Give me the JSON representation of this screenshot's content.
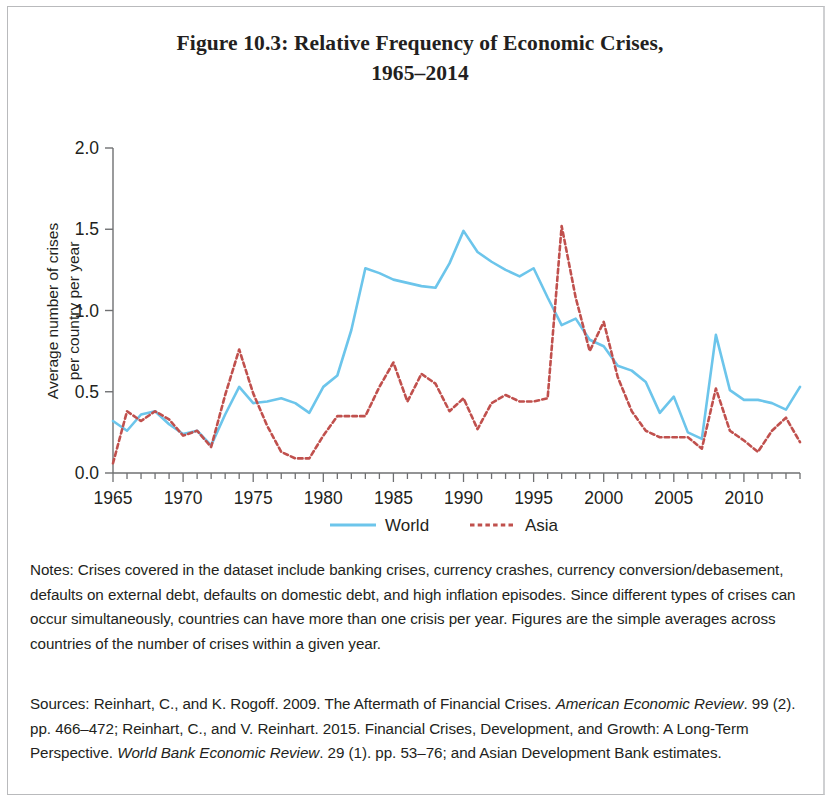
{
  "figure": {
    "title_line1": "Figure 10.3: Relative Frequency of Economic Crises,",
    "title_line2": "1965–2014"
  },
  "axes": {
    "y_axis_label_line1": "Average number of crises",
    "y_axis_label_line2": "per country per year",
    "y_ticks": [
      "0.0",
      "0.5",
      "1.0",
      "1.5",
      "2.0"
    ],
    "x_ticks": [
      "1965",
      "1970",
      "1975",
      "1980",
      "1985",
      "1990",
      "1995",
      "2000",
      "2005",
      "2010"
    ]
  },
  "legend": {
    "items": [
      {
        "label": "World",
        "color": "#6CC5EB",
        "style": "solid"
      },
      {
        "label": "Asia",
        "color": "#C0504D",
        "style": "dotted"
      }
    ]
  },
  "notes": {
    "text": "Notes: Crises covered in the dataset include banking crises, currency crashes, currency conversion/debasement, defaults on external debt, defaults on domestic debt, and high inflation episodes. Since different types of crises can occur simultaneously, countries can have more than one crisis per year. Figures are the simple averages across countries of the number of crises within a given year."
  },
  "sources": {
    "part1": "Sources: Reinhart, C., and K. Rogoff. 2009. The Aftermath of Financial Crises. ",
    "italic1": "American Economic Review",
    "part2": ". 99 (2). pp. 466–472; Reinhart, C., and V. Reinhart. 2015. Financial Crises, Development, and Growth: A Long-Term Perspective. ",
    "italic2": "World Bank Economic Review",
    "part3": ". 29 (1). pp. 53–76; and Asian Development Bank estimates."
  },
  "chart_data": {
    "type": "line",
    "title": "Figure 10.3: Relative Frequency of Economic Crises, 1965–2014",
    "xlabel": "",
    "ylabel": "Average number of crises per country per year",
    "xlim": [
      1965,
      2014
    ],
    "ylim": [
      0.0,
      2.0
    ],
    "yticks": [
      0.0,
      0.5,
      1.0,
      1.5,
      2.0
    ],
    "xticks": [
      1965,
      1970,
      1975,
      1980,
      1985,
      1990,
      1995,
      2000,
      2005,
      2010
    ],
    "grid": false,
    "legend_position": "bottom",
    "x": [
      1965,
      1966,
      1967,
      1968,
      1969,
      1970,
      1971,
      1972,
      1973,
      1974,
      1975,
      1976,
      1977,
      1978,
      1979,
      1980,
      1981,
      1982,
      1983,
      1984,
      1985,
      1986,
      1987,
      1988,
      1989,
      1990,
      1991,
      1992,
      1993,
      1994,
      1995,
      1996,
      1997,
      1998,
      1999,
      2000,
      2001,
      2002,
      2003,
      2004,
      2005,
      2006,
      2007,
      2008,
      2009,
      2010,
      2011,
      2012,
      2013,
      2014
    ],
    "series": [
      {
        "name": "World",
        "color": "#6CC5EB",
        "style": "solid",
        "values": [
          0.32,
          0.26,
          0.36,
          0.38,
          0.3,
          0.24,
          0.26,
          0.17,
          0.36,
          0.53,
          0.43,
          0.44,
          0.46,
          0.43,
          0.37,
          0.53,
          0.6,
          0.88,
          1.26,
          1.23,
          1.19,
          1.17,
          1.15,
          1.14,
          1.29,
          1.49,
          1.36,
          1.3,
          1.25,
          1.21,
          1.26,
          1.08,
          0.91,
          0.95,
          0.82,
          0.78,
          0.66,
          0.63,
          0.56,
          0.37,
          0.47,
          0.25,
          0.21,
          0.85,
          0.51,
          0.45,
          0.45,
          0.43,
          0.39,
          0.53
        ]
      },
      {
        "name": "Asia",
        "color": "#C0504D",
        "style": "dotted",
        "values": [
          0.06,
          0.38,
          0.32,
          0.38,
          0.33,
          0.23,
          0.26,
          0.16,
          0.48,
          0.76,
          0.49,
          0.29,
          0.13,
          0.09,
          0.09,
          0.23,
          0.35,
          0.35,
          0.35,
          0.53,
          0.68,
          0.44,
          0.61,
          0.55,
          0.38,
          0.46,
          0.27,
          0.43,
          0.48,
          0.44,
          0.44,
          0.46,
          1.52,
          1.08,
          0.75,
          0.93,
          0.59,
          0.38,
          0.26,
          0.22,
          0.22,
          0.22,
          0.15,
          0.52,
          0.26,
          0.2,
          0.13,
          0.26,
          0.34,
          0.19
        ]
      }
    ]
  }
}
